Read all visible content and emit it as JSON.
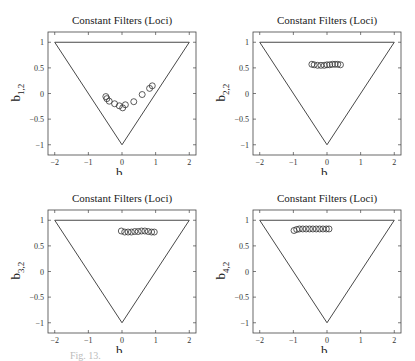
{
  "figure": {
    "caption": "Fig. 13."
  },
  "chart_data": [
    {
      "type": "scatter",
      "title": "Constant Filters (Loci)",
      "xlabel": "b_{1,1}",
      "xlabel_main": "b",
      "xlabel_sub": "1,1",
      "ylabel": "b_{1,2}",
      "ylabel_main": "b",
      "ylabel_sub": "1,2",
      "xlim": [
        -2.2,
        2.2
      ],
      "ylim": [
        -1.2,
        1.2
      ],
      "xticks": [
        -2,
        -1,
        0,
        1,
        2
      ],
      "yticks": [
        -1,
        -0.5,
        0,
        0.5,
        1
      ],
      "ytick_labels": [
        "-1",
        "-0.5",
        "0",
        "0.5",
        "1"
      ],
      "grid": false,
      "boundary": {
        "name": "stability triangle",
        "vertices": [
          [
            -2,
            1
          ],
          [
            2,
            1
          ],
          [
            0,
            -1
          ]
        ]
      },
      "points": [
        [
          -0.48,
          -0.06
        ],
        [
          -0.45,
          -0.1
        ],
        [
          -0.38,
          -0.15
        ],
        [
          -0.22,
          -0.2
        ],
        [
          -0.08,
          -0.24
        ],
        [
          0.02,
          -0.28
        ],
        [
          0.1,
          -0.22
        ],
        [
          0.35,
          -0.16
        ],
        [
          0.6,
          -0.02
        ],
        [
          0.82,
          0.1
        ],
        [
          0.9,
          0.15
        ]
      ],
      "marker": "open circle"
    },
    {
      "type": "scatter",
      "title": "Constant Filters (Loci)",
      "xlabel": "b_{2,1}",
      "xlabel_main": "b",
      "xlabel_sub": "2,1",
      "ylabel": "b_{2,2}",
      "ylabel_main": "b",
      "ylabel_sub": "2,2",
      "xlim": [
        -2.2,
        2.2
      ],
      "ylim": [
        -1.2,
        1.2
      ],
      "xticks": [
        -2,
        -1,
        0,
        1,
        2
      ],
      "yticks": [
        -1,
        -0.5,
        0,
        0.5,
        1
      ],
      "ytick_labels": [
        "-1",
        "-0.5",
        "0",
        "0.5",
        "1"
      ],
      "grid": false,
      "boundary": {
        "name": "stability triangle",
        "vertices": [
          [
            -2,
            1
          ],
          [
            2,
            1
          ],
          [
            0,
            -1
          ]
        ]
      },
      "points": [
        [
          -0.45,
          0.57
        ],
        [
          -0.38,
          0.56
        ],
        [
          -0.28,
          0.55
        ],
        [
          -0.18,
          0.55
        ],
        [
          -0.08,
          0.55
        ],
        [
          0.0,
          0.56
        ],
        [
          0.08,
          0.56
        ],
        [
          0.16,
          0.57
        ],
        [
          0.24,
          0.57
        ],
        [
          0.32,
          0.57
        ],
        [
          0.4,
          0.56
        ]
      ],
      "marker": "open circle"
    },
    {
      "type": "scatter",
      "title": "Constant Filters (Loci)",
      "xlabel": "b_{3,1}",
      "xlabel_main": "b",
      "xlabel_sub": "3,1",
      "ylabel": "b_{3,2}",
      "ylabel_main": "b",
      "ylabel_sub": "3,2",
      "xlim": [
        -2.2,
        2.2
      ],
      "ylim": [
        -1.2,
        1.2
      ],
      "xticks": [
        -2,
        -1,
        0,
        1,
        2
      ],
      "yticks": [
        -1,
        -0.5,
        0,
        0.5,
        1
      ],
      "ytick_labels": [
        "-1",
        "-0.5",
        "0",
        "0.5",
        "1"
      ],
      "grid": false,
      "boundary": {
        "name": "stability triangle",
        "vertices": [
          [
            -2,
            1
          ],
          [
            2,
            1
          ],
          [
            0,
            -1
          ]
        ]
      },
      "points": [
        [
          -0.02,
          0.79
        ],
        [
          0.08,
          0.77
        ],
        [
          0.18,
          0.77
        ],
        [
          0.28,
          0.77
        ],
        [
          0.38,
          0.78
        ],
        [
          0.48,
          0.78
        ],
        [
          0.58,
          0.79
        ],
        [
          0.68,
          0.79
        ],
        [
          0.78,
          0.78
        ],
        [
          0.88,
          0.77
        ],
        [
          0.96,
          0.77
        ]
      ],
      "marker": "open circle"
    },
    {
      "type": "scatter",
      "title": "Constant Filters (Loci)",
      "xlabel": "b_{4,1}",
      "xlabel_main": "b",
      "xlabel_sub": "4,1",
      "ylabel": "b_{4,2}",
      "ylabel_main": "b",
      "ylabel_sub": "4,2",
      "xlim": [
        -2.2,
        2.2
      ],
      "ylim": [
        -1.2,
        1.2
      ],
      "xticks": [
        -2,
        -1,
        0,
        1,
        2
      ],
      "yticks": [
        -1,
        -0.5,
        0,
        0.5,
        1
      ],
      "ytick_labels": [
        "-1",
        "-0.5",
        "0",
        "0.5",
        "1"
      ],
      "grid": false,
      "boundary": {
        "name": "stability triangle",
        "vertices": [
          [
            -2,
            1
          ],
          [
            2,
            1
          ],
          [
            0,
            -1
          ]
        ]
      },
      "points": [
        [
          -0.98,
          0.8
        ],
        [
          -0.9,
          0.82
        ],
        [
          -0.82,
          0.83
        ],
        [
          -0.72,
          0.83
        ],
        [
          -0.62,
          0.83
        ],
        [
          -0.52,
          0.83
        ],
        [
          -0.42,
          0.83
        ],
        [
          -0.32,
          0.83
        ],
        [
          -0.22,
          0.83
        ],
        [
          -0.12,
          0.83
        ],
        [
          -0.02,
          0.83
        ],
        [
          0.06,
          0.83
        ]
      ],
      "marker": "open circle"
    }
  ]
}
